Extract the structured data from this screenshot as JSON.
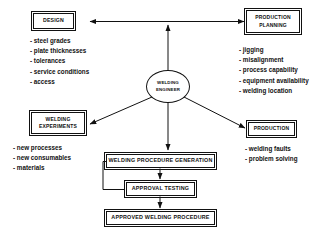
{
  "diagram": {
    "center": {
      "label_line1": "WELDING",
      "label_line2": "ENGINEER"
    },
    "nodes": {
      "design": {
        "label": "DESIGN"
      },
      "production_planning": {
        "label_line1": "PRODUCTION",
        "label_line2": "PLANNING"
      },
      "welding_experiments": {
        "label_line1": "WELDING",
        "label_line2": "EXPERIMENTS"
      },
      "production": {
        "label": "PRODUCTION"
      },
      "procedure_generation": {
        "label": "WELDING PROCEDURE GENERATION"
      },
      "approval_testing": {
        "label": "APPROVAL TESTING"
      },
      "approved_procedure": {
        "label": "APPROVED WELDING PROCEDURE"
      }
    },
    "bullet_lists": {
      "design": [
        "- steel grades",
        "- plate thicknesses",
        "- tolerances",
        "- service conditions",
        "- access"
      ],
      "production_planning": [
        "- jigging",
        "- misalignment",
        "- process capability",
        "- equipment availability",
        "- welding location"
      ],
      "welding_experiments": [
        "- new processes",
        "- new consumables",
        "- materials"
      ],
      "production": [
        "- welding faults",
        "- problem solving"
      ]
    },
    "colors": {
      "line": "#111111",
      "background": "#ffffff",
      "text": "#111111"
    }
  }
}
